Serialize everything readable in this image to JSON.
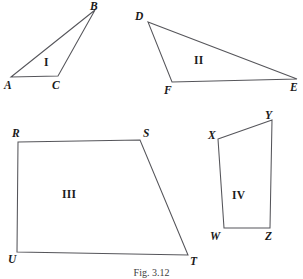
{
  "figure": {
    "caption": "Fig. 3.12",
    "width": 303,
    "height": 279,
    "stroke_color": "#55555a",
    "background_color": "#ffffff",
    "text_color": "#1a1a1a"
  },
  "shapes": [
    {
      "id": "shape-1",
      "region_label": "I",
      "region_label_x": 44,
      "region_label_y": 57,
      "kind": "triangle",
      "points": "11,77 95,10 58,76",
      "vertices": [
        {
          "name": "A",
          "x": 11,
          "y": 77,
          "label_x": 4,
          "label_y": 80
        },
        {
          "name": "B",
          "x": 95,
          "y": 10,
          "label_x": 90,
          "label_y": 1
        },
        {
          "name": "C",
          "x": 58,
          "y": 76,
          "label_x": 52,
          "label_y": 80
        }
      ]
    },
    {
      "id": "shape-2",
      "region_label": "II",
      "region_label_x": 194,
      "region_label_y": 55,
      "kind": "triangle",
      "points": "148,22 297,79 172,82",
      "vertices": [
        {
          "name": "D",
          "x": 148,
          "y": 22,
          "label_x": 135,
          "label_y": 11
        },
        {
          "name": "E",
          "x": 297,
          "y": 79,
          "label_x": 290,
          "label_y": 82
        },
        {
          "name": "F",
          "x": 172,
          "y": 82,
          "label_x": 164,
          "label_y": 85
        }
      ]
    },
    {
      "id": "shape-3",
      "region_label": "III",
      "region_label_x": 62,
      "region_label_y": 189,
      "kind": "quadrilateral",
      "points": "18,142 140,140 188,255 17,252",
      "vertices": [
        {
          "name": "R",
          "x": 18,
          "y": 142,
          "label_x": 12,
          "label_y": 128
        },
        {
          "name": "S",
          "x": 140,
          "y": 140,
          "label_x": 143,
          "label_y": 128
        },
        {
          "name": "T",
          "x": 188,
          "y": 255,
          "label_x": 190,
          "label_y": 256
        },
        {
          "name": "U",
          "x": 17,
          "y": 252,
          "label_x": 8,
          "label_y": 254
        }
      ]
    },
    {
      "id": "shape-4",
      "region_label": "IV",
      "region_label_x": 232,
      "region_label_y": 190,
      "kind": "quadrilateral",
      "points": "218,139 272,120 270,228 224,228",
      "vertices": [
        {
          "name": "X",
          "x": 218,
          "y": 139,
          "label_x": 208,
          "label_y": 130
        },
        {
          "name": "Y",
          "x": 272,
          "y": 120,
          "label_x": 265,
          "label_y": 110
        },
        {
          "name": "Z",
          "x": 270,
          "y": 228,
          "label_x": 265,
          "label_y": 231
        },
        {
          "name": "W",
          "x": 224,
          "y": 228,
          "label_x": 210,
          "label_y": 231
        }
      ]
    }
  ]
}
